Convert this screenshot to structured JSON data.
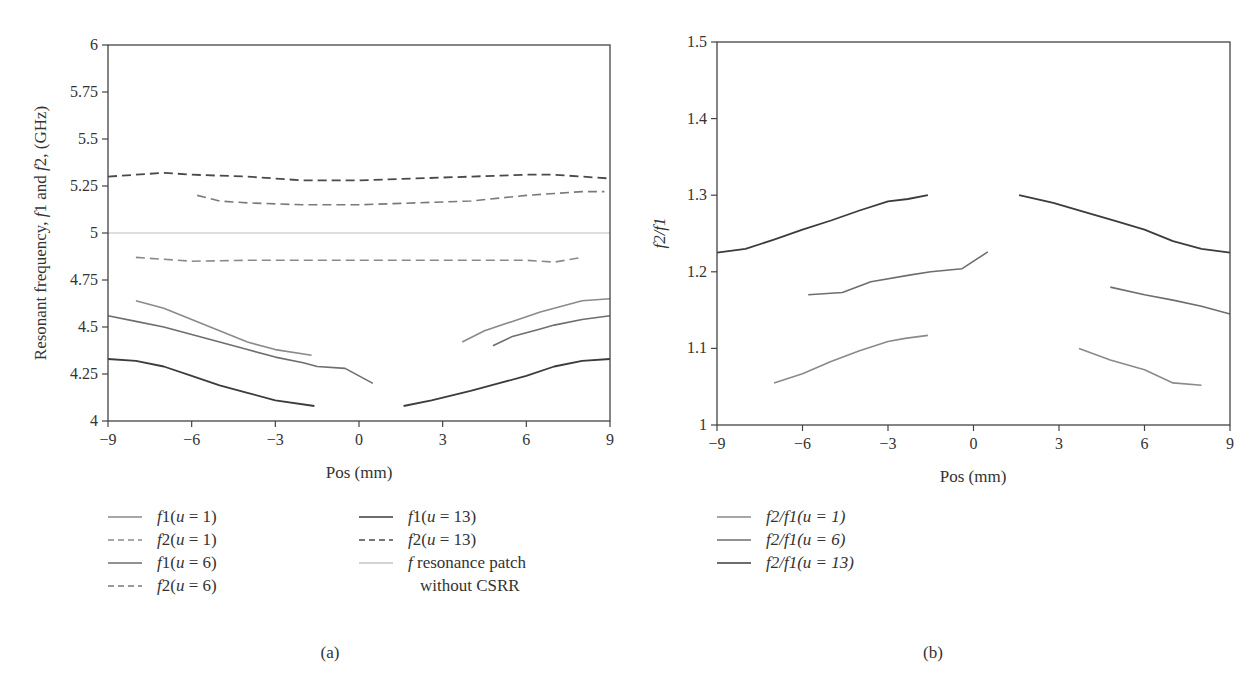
{
  "figure": {
    "panel_a": {
      "caption": "(a)",
      "ylabel_parts": [
        "Resonant frequency, ",
        "f",
        "1 and ",
        "f",
        "2, (GHz)"
      ],
      "xlabel": "Pos (mm)"
    },
    "panel_b": {
      "caption": "(b)",
      "ylabel": "f2/f1",
      "xlabel": "Pos (mm)"
    }
  },
  "chart_data": [
    {
      "type": "line",
      "title": "(a)",
      "xlabel": "Pos (mm)",
      "ylabel": "Resonant frequency, f1 and f2, (GHz)",
      "xlim": [
        -9,
        9
      ],
      "ylim": [
        4,
        6
      ],
      "xticks": [
        -9,
        -6,
        -3,
        0,
        3,
        6,
        9
      ],
      "yticks": [
        4,
        4.25,
        4.5,
        4.75,
        5,
        5.25,
        5.5,
        5.75,
        6
      ],
      "ytick_labels": [
        "4",
        "4.25",
        "4.5",
        "4.75",
        "5",
        "5.25",
        "5.5",
        "5.75",
        "6"
      ],
      "grid": false,
      "legend_position": "below",
      "series": [
        {
          "name": "f1(u = 1)",
          "style": "solid",
          "color": "#8a8a8a",
          "width": 1.6,
          "segments": [
            {
              "x": [
                -8,
                -7,
                -6,
                -5,
                -4,
                -3,
                -1.7
              ],
              "y": [
                4.64,
                4.6,
                4.54,
                4.48,
                4.42,
                4.38,
                4.35
              ]
            },
            {
              "x": [
                3.7,
                4.5,
                5.5,
                6.5,
                7,
                8,
                9
              ],
              "y": [
                4.42,
                4.48,
                4.53,
                4.58,
                4.6,
                4.64,
                4.65
              ]
            }
          ]
        },
        {
          "name": "f2(u = 1)",
          "style": "dashed",
          "color": "#8a8a8a",
          "width": 1.6,
          "segments": [
            {
              "x": [
                -8,
                -6,
                -4,
                -2,
                0,
                2,
                4,
                6,
                7,
                8
              ],
              "y": [
                4.87,
                4.85,
                4.855,
                4.855,
                4.855,
                4.855,
                4.855,
                4.855,
                4.845,
                4.87
              ]
            }
          ]
        },
        {
          "name": "f1(u = 6)",
          "style": "solid",
          "color": "#6e6e6e",
          "width": 1.6,
          "segments": [
            {
              "x": [
                -9,
                -8,
                -7,
                -6,
                -5,
                -4,
                -3,
                -2,
                -1.5,
                -0.5,
                0.5
              ],
              "y": [
                4.56,
                4.53,
                4.5,
                4.46,
                4.42,
                4.38,
                4.34,
                4.31,
                4.29,
                4.28,
                4.2
              ]
            },
            {
              "x": [
                4.8,
                5.5,
                6.5,
                7,
                8,
                9
              ],
              "y": [
                4.4,
                4.45,
                4.49,
                4.51,
                4.54,
                4.56
              ]
            }
          ]
        },
        {
          "name": "f2(u = 6)",
          "style": "dashed",
          "color": "#7a7a7a",
          "width": 1.6,
          "segments": [
            {
              "x": [
                -5.8,
                -5,
                -4,
                -2,
                0,
                2,
                4,
                6,
                7,
                8,
                8.8
              ],
              "y": [
                5.2,
                5.17,
                5.16,
                5.15,
                5.15,
                5.16,
                5.17,
                5.2,
                5.21,
                5.22,
                5.22
              ]
            }
          ]
        },
        {
          "name": "f1(u = 13)",
          "style": "solid",
          "color": "#3c3c3c",
          "width": 1.8,
          "segments": [
            {
              "x": [
                -9,
                -8,
                -7,
                -6,
                -5,
                -4,
                -3,
                -1.6
              ],
              "y": [
                4.33,
                4.32,
                4.29,
                4.24,
                4.19,
                4.15,
                4.11,
                4.08
              ]
            },
            {
              "x": [
                1.6,
                2.6,
                4,
                5,
                6,
                7,
                8,
                9
              ],
              "y": [
                4.08,
                4.11,
                4.16,
                4.2,
                4.24,
                4.29,
                4.32,
                4.33
              ]
            }
          ]
        },
        {
          "name": "f2(u = 13)",
          "style": "dashed",
          "color": "#4a4a4a",
          "width": 1.8,
          "segments": [
            {
              "x": [
                -9,
                -8,
                -7,
                -6,
                -4,
                -2,
                0,
                2,
                4,
                6,
                7,
                8,
                9
              ],
              "y": [
                5.3,
                5.31,
                5.32,
                5.31,
                5.3,
                5.28,
                5.28,
                5.29,
                5.3,
                5.31,
                5.31,
                5.3,
                5.29
              ]
            }
          ]
        },
        {
          "name": "f resonance patch without CSRR",
          "style": "solid",
          "color": "#bdbdbd",
          "width": 1.2,
          "segments": [
            {
              "x": [
                -9,
                9
              ],
              "y": [
                5.0,
                5.0
              ]
            }
          ]
        }
      ]
    },
    {
      "type": "line",
      "title": "(b)",
      "xlabel": "Pos (mm)",
      "ylabel": "f2/f1",
      "xlim": [
        -9,
        9
      ],
      "ylim": [
        1,
        1.5
      ],
      "xticks": [
        -9,
        -6,
        -3,
        0,
        3,
        6,
        9
      ],
      "yticks": [
        1,
        1.1,
        1.2,
        1.3,
        1.4,
        1.5
      ],
      "ytick_labels": [
        "1",
        "1.1",
        "1.2",
        "1.3",
        "1.4",
        "1.5"
      ],
      "grid": false,
      "legend_position": "below",
      "series": [
        {
          "name": "f2/f1(u = 1)",
          "style": "solid",
          "color": "#8a8a8a",
          "width": 1.6,
          "segments": [
            {
              "x": [
                -7,
                -6,
                -5,
                -4,
                -3,
                -2.4,
                -1.6
              ],
              "y": [
                1.055,
                1.067,
                1.083,
                1.097,
                1.109,
                1.113,
                1.117
              ]
            },
            {
              "x": [
                3.7,
                4.8,
                6,
                7,
                8
              ],
              "y": [
                1.1,
                1.085,
                1.072,
                1.055,
                1.052
              ]
            }
          ]
        },
        {
          "name": "f2/f1(u = 6)",
          "style": "solid",
          "color": "#6e6e6e",
          "width": 1.6,
          "segments": [
            {
              "x": [
                -5.8,
                -4.6,
                -3.6,
                -2.2,
                -1.5,
                -0.4,
                0.5
              ],
              "y": [
                1.17,
                1.173,
                1.187,
                1.196,
                1.2,
                1.204,
                1.226
              ]
            },
            {
              "x": [
                4.8,
                6,
                7,
                8,
                9
              ],
              "y": [
                1.18,
                1.17,
                1.163,
                1.155,
                1.145
              ]
            }
          ]
        },
        {
          "name": "f2/f1(u = 13)",
          "style": "solid",
          "color": "#3c3c3c",
          "width": 1.8,
          "segments": [
            {
              "x": [
                -9,
                -8,
                -7,
                -6,
                -5,
                -4,
                -3,
                -2.3,
                -1.6
              ],
              "y": [
                1.225,
                1.23,
                1.242,
                1.255,
                1.267,
                1.28,
                1.292,
                1.295,
                1.3
              ]
            },
            {
              "x": [
                1.6,
                2.8,
                4,
                5,
                6,
                7,
                8,
                9
              ],
              "y": [
                1.3,
                1.29,
                1.277,
                1.266,
                1.255,
                1.24,
                1.23,
                1.225
              ]
            }
          ]
        }
      ]
    }
  ],
  "legend_a": {
    "left": [
      {
        "label_italic": "f",
        "label_rest": "1(",
        "u": "u",
        "tail": " = 1)",
        "style": "solid",
        "color": "#8a8a8a"
      },
      {
        "label_italic": "f",
        "label_rest": "2(",
        "u": "u",
        "tail": " = 1)",
        "style": "dashed",
        "color": "#8a8a8a"
      },
      {
        "label_italic": "f",
        "label_rest": "1(",
        "u": "u",
        "tail": " = 6)",
        "style": "solid",
        "color": "#6e6e6e"
      },
      {
        "label_italic": "f",
        "label_rest": "2(",
        "u": "u",
        "tail": " = 6)",
        "style": "dashed",
        "color": "#7a7a7a"
      }
    ],
    "right": [
      {
        "label_italic": "f",
        "label_rest": "1(",
        "u": "u",
        "tail": " = 13)",
        "style": "solid",
        "color": "#3c3c3c"
      },
      {
        "label_italic": "f",
        "label_rest": "2(",
        "u": "u",
        "tail": " = 13)",
        "style": "dashed",
        "color": "#4a4a4a"
      },
      {
        "label_italic": "f",
        "label_rest": " resonance patch",
        "u": "",
        "tail": "",
        "style": "solid",
        "color": "#c4c4c4"
      }
    ],
    "right_continuation": "without CSRR"
  },
  "legend_b": [
    {
      "label": "f2/f1(u = 1)",
      "color": "#8a8a8a"
    },
    {
      "label": "f2/f1(u = 6)",
      "color": "#6e6e6e"
    },
    {
      "label": "f2/f1(u = 13)",
      "color": "#3c3c3c"
    }
  ]
}
